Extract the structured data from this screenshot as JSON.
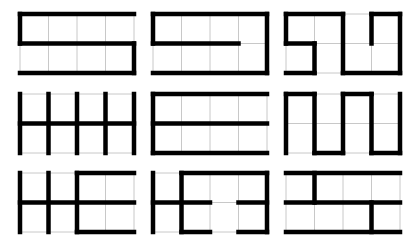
{
  "figure": {
    "colors": {
      "background": "#ffffff",
      "grid_line": "#c8c8c8",
      "path_line": "#000000"
    },
    "grid_cols": 4,
    "grid_rows": 2,
    "cell_w": 28.5,
    "cell_h": 29.5,
    "columns_x": [
      20,
      153,
      286
    ],
    "rows_y": [
      14,
      94,
      173
    ],
    "puzzles": [
      {
        "id": "grid-1",
        "segments": [
          [
            0,
            0,
            4,
            0
          ],
          [
            0,
            0,
            0,
            1
          ],
          [
            0,
            1,
            4,
            1
          ],
          [
            4,
            1,
            4,
            2
          ],
          [
            0,
            2,
            4,
            2
          ]
        ]
      },
      {
        "id": "grid-2",
        "segments": [
          [
            0,
            0,
            4,
            0
          ],
          [
            0,
            0,
            0,
            1
          ],
          [
            0,
            1,
            3,
            1
          ],
          [
            4,
            0,
            4,
            2
          ],
          [
            0,
            2,
            4,
            2
          ]
        ]
      },
      {
        "id": "grid-3",
        "segments": [
          [
            0,
            0,
            2,
            0
          ],
          [
            0,
            0,
            0,
            1
          ],
          [
            0,
            1,
            1,
            1
          ],
          [
            1,
            1,
            1,
            2
          ],
          [
            0,
            2,
            1,
            2
          ],
          [
            2,
            0,
            2,
            2
          ],
          [
            2,
            2,
            4,
            2
          ],
          [
            4,
            0,
            4,
            2
          ],
          [
            3,
            0,
            4,
            0
          ],
          [
            3,
            0,
            3,
            1
          ]
        ]
      },
      {
        "id": "grid-4",
        "segments": [
          [
            0,
            0,
            0,
            2
          ],
          [
            1,
            0,
            1,
            2
          ],
          [
            2,
            0,
            2,
            2
          ],
          [
            3,
            0,
            3,
            2
          ],
          [
            4,
            0,
            4,
            2
          ],
          [
            0,
            1,
            4,
            1
          ]
        ]
      },
      {
        "id": "grid-5",
        "segments": [
          [
            0,
            0,
            0,
            2
          ],
          [
            0,
            0,
            4,
            0
          ],
          [
            0,
            1,
            4,
            1
          ],
          [
            0,
            2,
            4,
            2
          ]
        ]
      },
      {
        "id": "grid-6",
        "segments": [
          [
            0,
            0,
            0,
            2
          ],
          [
            0,
            0,
            1,
            0
          ],
          [
            1,
            0,
            1,
            2
          ],
          [
            1,
            2,
            2,
            2
          ],
          [
            2,
            0,
            2,
            2
          ],
          [
            2,
            0,
            3,
            0
          ],
          [
            3,
            0,
            3,
            2
          ],
          [
            3,
            2,
            4,
            2
          ],
          [
            4,
            0,
            4,
            2
          ]
        ]
      },
      {
        "id": "grid-7",
        "segments": [
          [
            0,
            0,
            0,
            2
          ],
          [
            1,
            0,
            1,
            2
          ],
          [
            2,
            0,
            2,
            2
          ],
          [
            0,
            1,
            4,
            1
          ],
          [
            2,
            0,
            4,
            0
          ],
          [
            2,
            2,
            4,
            2
          ]
        ]
      },
      {
        "id": "grid-8",
        "segments": [
          [
            0,
            0,
            0,
            2
          ],
          [
            1,
            0,
            1,
            2
          ],
          [
            1,
            0,
            4,
            0
          ],
          [
            4,
            0,
            4,
            2
          ],
          [
            0,
            1,
            2,
            1
          ],
          [
            3,
            1,
            4,
            1
          ],
          [
            1,
            2,
            2,
            2
          ],
          [
            3,
            2,
            4,
            2
          ]
        ]
      },
      {
        "id": "grid-9",
        "segments": [
          [
            0,
            0,
            4,
            0
          ],
          [
            0,
            1,
            4,
            1
          ],
          [
            0,
            2,
            4,
            2
          ],
          [
            1,
            0,
            1,
            1
          ],
          [
            3,
            1,
            3,
            2
          ]
        ]
      }
    ]
  }
}
